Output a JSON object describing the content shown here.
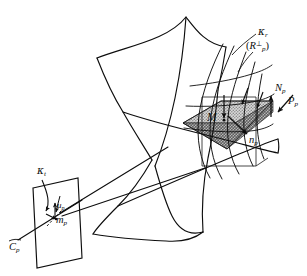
{
  "figure": {
    "background_color": "#ffffff",
    "ink_color": "#0d0d0d",
    "width": 307,
    "height": 276,
    "shading": {
      "tangent_plane_light": "#b4b4b4",
      "tangent_plane_dark": "#8e8e8e",
      "stipple_pattern": "halftone-gray-dots"
    }
  },
  "labels": {
    "kappa_r": {
      "text": "κ",
      "sub": "r",
      "x": 258,
      "y": 30
    },
    "r_perp": {
      "open": "(",
      "base": "R",
      "sub": "p",
      "sup": "⊥",
      "close": ")",
      "x": 248,
      "y": 47
    },
    "n_cap_p": {
      "text": "N",
      "sub": "p",
      "x": 275,
      "y": 88
    },
    "p_cap_p": {
      "text": "P",
      "sub": "p",
      "x": 288,
      "y": 101
    },
    "m_point": {
      "text": "M",
      "x": 210,
      "y": 117
    },
    "n_small_p": {
      "text": "n",
      "sub": "p",
      "x": 251,
      "y": 140
    },
    "kappa_t": {
      "text": "κ",
      "sub": "t",
      "x": 38,
      "y": 169
    },
    "u_p": {
      "text": "u",
      "sub": "p",
      "x": 58,
      "y": 206
    },
    "m_small_p": {
      "text": "m",
      "sub": "p",
      "x": 58,
      "y": 220
    },
    "c_p": {
      "text": "C",
      "sub": "p",
      "x": 10,
      "y": 247
    }
  },
  "elements": {
    "surface": "hyperbolic-paraboloid-style-curved-sheet",
    "tangent_plane": "shaded-parallelogram-at-M",
    "vertical_plane": "outlined-rectangle-behind-tangent-plane",
    "normal_vector": "N_p arrow pointing up at right edge",
    "view_vector": "P_p arrow pointing down-right",
    "surface_normal_small": "n_p arrow on tangent plane",
    "image_plane": "camera-image-plane-parallelogram",
    "optical_center_ray": "C_p ray through image plane",
    "sight_lines": "two long rays from camera to surface",
    "iso_curves": "family of curves on surface near M"
  }
}
